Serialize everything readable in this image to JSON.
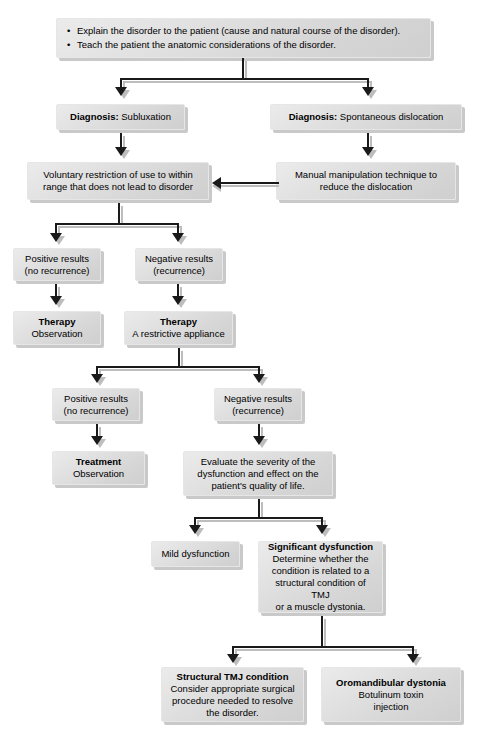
{
  "diagram": {
    "colors": {
      "box_fill_light": "#ebebeb",
      "box_fill_dark": "#cfcfcf",
      "box_shadow": "#c9c9c9",
      "connector": "#1a1a1a",
      "connector_shadow": "#bdbdbd",
      "text": "#000000",
      "background": "#ffffff"
    },
    "nodes": {
      "education": {
        "bullets": [
          "Explain the disorder to the patient (cause and natural course of the disorder).",
          "Teach the patient the anatomic considerations of the disorder."
        ]
      },
      "diagnosis_subluxation": {
        "label": "Diagnosis:",
        "value": "Subluxation"
      },
      "diagnosis_spontaneous": {
        "label": "Diagnosis:",
        "value": "Spontaneous dislocation"
      },
      "voluntary_restriction": {
        "line1": "Voluntary restriction of use to within",
        "line2": "range that does not lead to disorder"
      },
      "manual_manipulation": {
        "line1": "Manual manipulation technique to",
        "line2": "reduce the dislocation"
      },
      "positive_results_1": {
        "line1": "Positive results",
        "line2": "(no recurrence)"
      },
      "negative_results_1": {
        "line1": "Negative results",
        "line2": "(recurrence)"
      },
      "therapy_observation": {
        "title": "Therapy",
        "line1": "Observation"
      },
      "therapy_appliance": {
        "title": "Therapy",
        "line1": "A restrictive appliance"
      },
      "positive_results_2": {
        "line1": "Positive results",
        "line2": "(no recurrence)"
      },
      "negative_results_2": {
        "line1": "Negative results",
        "line2": "(recurrence)"
      },
      "treatment_observation": {
        "title": "Treatment",
        "line1": "Observation"
      },
      "evaluate_severity": {
        "line1": "Evaluate the severity of the",
        "line2": "dysfunction and effect on the",
        "line3": "patient's quality of life."
      },
      "mild_dysfunction": {
        "line1": "Mild dysfunction"
      },
      "significant_dysfunction": {
        "title": "Significant dysfunction",
        "line1": "Determine whether the",
        "line2": "condition is related to a",
        "line3": "structural condition of TMJ",
        "line4": "or a muscle dystonia."
      },
      "structural_tmj": {
        "title": "Structural TMJ condition",
        "line1": "Consider appropriate surgical",
        "line2": "procedure needed to resolve",
        "line3": "the disorder."
      },
      "oromandibular_dystonia": {
        "title": "Oromandibular dystonia",
        "line1": "Botulinum toxin",
        "line2": "injection"
      }
    }
  }
}
